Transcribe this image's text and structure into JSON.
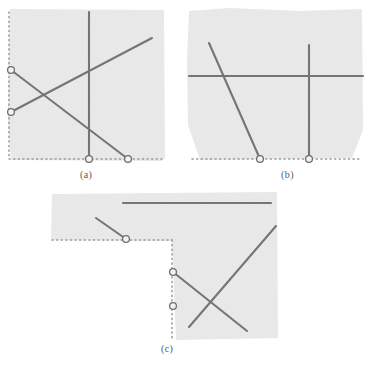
{
  "figure": {
    "title": "",
    "caption_font_color": "#5a5a5a",
    "background_color": "#ffffff",
    "panel_fill_color": "#ebebeb",
    "line_color": "#757575",
    "dotted_color": "#9a9a9a",
    "marker_fill_color": "#f3f3f3",
    "marker_stroke_color": "#6e6e6e",
    "panels": [
      {
        "id": "a",
        "caption": "(a)",
        "caption_x": 80,
        "caption_y": 169,
        "region": {
          "x": 8,
          "y": 8,
          "width": 158,
          "height": 152
        },
        "dotted_axes": [
          {
            "name": "left-axis",
            "x1": 9,
            "y1": 12,
            "x2": 9,
            "y2": 159
          },
          {
            "name": "bottom-axis",
            "x1": 9,
            "y1": 159,
            "x2": 163,
            "y2": 159
          }
        ],
        "segments": [
          {
            "name": "vertical-segment",
            "x1": 89,
            "y1": 12,
            "x2": 89,
            "y2": 159
          },
          {
            "name": "ascending-segment",
            "x1": 11,
            "y1": 112,
            "x2": 152,
            "y2": 38
          },
          {
            "name": "descending-segment",
            "x1": 11,
            "y1": 70,
            "x2": 128,
            "y2": 159
          }
        ],
        "markers": [
          {
            "name": "marker-left-upper",
            "cx": 11,
            "cy": 70,
            "r": 3.4
          },
          {
            "name": "marker-left-lower",
            "cx": 11,
            "cy": 112,
            "r": 3.4
          },
          {
            "name": "marker-bottom-left",
            "cx": 89,
            "cy": 159,
            "r": 3.4
          },
          {
            "name": "marker-bottom-right",
            "cx": 128,
            "cy": 159,
            "r": 3.4
          }
        ]
      },
      {
        "id": "b",
        "caption": "(b)",
        "caption_x": 281,
        "caption_y": 169,
        "region": {
          "x": 187,
          "y": 8,
          "width": 176,
          "height": 152
        },
        "dotted_axes": [
          {
            "name": "bottom-axis",
            "x1": 192,
            "y1": 159,
            "x2": 360,
            "y2": 159
          }
        ],
        "segments": [
          {
            "name": "horizontal-segment",
            "x1": 189,
            "y1": 76,
            "x2": 363,
            "y2": 76
          },
          {
            "name": "vertical-segment",
            "x1": 309,
            "y1": 45,
            "x2": 309,
            "y2": 159
          },
          {
            "name": "descending-segment",
            "x1": 209,
            "y1": 43,
            "x2": 260,
            "y2": 159
          }
        ],
        "markers": [
          {
            "name": "marker-bottom-left",
            "cx": 260,
            "cy": 159,
            "r": 3.4
          },
          {
            "name": "marker-bottom-right",
            "cx": 309,
            "cy": 159,
            "r": 3.4
          }
        ]
      },
      {
        "id": "c",
        "caption": "(c)",
        "caption_x": 161,
        "caption_y": 343,
        "region_upper": {
          "x": 50,
          "y": 192,
          "width": 228,
          "height": 48
        },
        "region_lower": {
          "x": 172,
          "y": 240,
          "width": 106,
          "height": 100
        },
        "dotted_axes": [
          {
            "name": "upper-bottom-axis",
            "x1": 52,
            "y1": 240,
            "x2": 172,
            "y2": 240
          },
          {
            "name": "step-vertical-axis",
            "x1": 172,
            "y1": 240,
            "x2": 172,
            "y2": 340
          }
        ],
        "segments": [
          {
            "name": "top-horizontal-segment",
            "x1": 123,
            "y1": 203,
            "x2": 271,
            "y2": 203
          },
          {
            "name": "short-descending-segment",
            "x1": 96,
            "y1": 218,
            "x2": 126,
            "y2": 239
          },
          {
            "name": "long-ascending-segment",
            "x1": 189,
            "y1": 327,
            "x2": 276,
            "y2": 226
          },
          {
            "name": "long-descending-segment",
            "x1": 173,
            "y1": 272,
            "x2": 247,
            "y2": 331
          }
        ],
        "markers": [
          {
            "name": "marker-upper-axis",
            "cx": 126,
            "cy": 239,
            "r": 3.4
          },
          {
            "name": "marker-step-upper",
            "cx": 173,
            "cy": 272,
            "r": 3.4
          },
          {
            "name": "marker-step-lower",
            "cx": 173,
            "cy": 306,
            "r": 3.4
          }
        ]
      }
    ]
  }
}
